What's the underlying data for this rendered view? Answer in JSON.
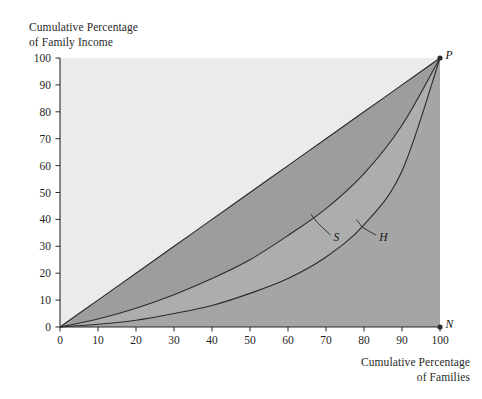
{
  "figure": {
    "background": "#ffffff",
    "plot_left": 60,
    "plot_right": 440,
    "plot_top": 58,
    "plot_bottom": 327
  },
  "axes": {
    "y_title": "Cumulative Percentage\nof Family Income",
    "x_title": "Cumulative Percentage\nof Families",
    "x_ticks": [
      "0",
      "10",
      "20",
      "30",
      "40",
      "50",
      "60",
      "70",
      "80",
      "90",
      "100"
    ],
    "y_ticks": [
      "0",
      "10",
      "20",
      "30",
      "40",
      "50",
      "60",
      "70",
      "80",
      "90",
      "100"
    ]
  },
  "markers": {
    "p_label": "P",
    "n_label": "N"
  },
  "curve_labels": {
    "s_label": "S",
    "h_label": "H"
  },
  "colors": {
    "above_diagonal_fill": "#ebebeb",
    "diagonal_to_s_fill": "#9d9d9d",
    "s_to_h_fill": "#adadad",
    "below_h_fill": "#a5a5a5",
    "line": "#2b2b2b",
    "text": "#1a1a1a"
  },
  "chart_data": {
    "type": "line",
    "title": "",
    "subtitle": "",
    "xlabel": "Cumulative Percentage of Families",
    "ylabel": "Cumulative Percentage of Family Income",
    "xlim": [
      0,
      100
    ],
    "ylim": [
      0,
      100
    ],
    "xticks": [
      0,
      10,
      20,
      30,
      40,
      50,
      60,
      70,
      80,
      90,
      100
    ],
    "yticks": [
      0,
      10,
      20,
      30,
      40,
      50,
      60,
      70,
      80,
      90,
      100
    ],
    "grid": false,
    "legend": "none",
    "annotations": [
      {
        "text": "P",
        "x": 100,
        "y": 100,
        "marker": "dot"
      },
      {
        "text": "N",
        "x": 100,
        "y": 0,
        "marker": "dot"
      },
      {
        "text": "S",
        "x": 72,
        "y": 33,
        "leader_to": [
          66,
          42
        ]
      },
      {
        "text": "H",
        "x": 84,
        "y": 33,
        "leader_to": [
          78,
          40
        ]
      }
    ],
    "x": [
      0,
      10,
      20,
      30,
      40,
      50,
      60,
      70,
      80,
      90,
      100
    ],
    "series": [
      {
        "name": "Line of equality (diagonal OP)",
        "values": [
          0,
          10,
          20,
          30,
          40,
          50,
          60,
          70,
          80,
          90,
          100
        ]
      },
      {
        "name": "S",
        "values": [
          0,
          3,
          7,
          12,
          18,
          25,
          34,
          44,
          57,
          75,
          100
        ]
      },
      {
        "name": "H",
        "values": [
          0,
          1,
          2.5,
          5,
          8,
          12.5,
          18,
          26,
          38,
          58,
          100
        ]
      }
    ]
  }
}
